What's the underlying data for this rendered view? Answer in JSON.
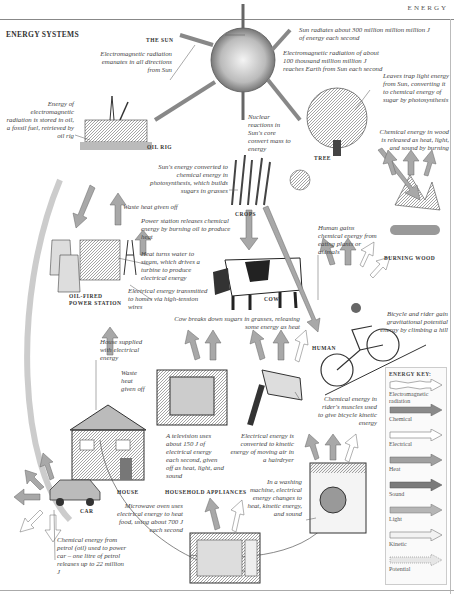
{
  "header": {
    "running_head": "ENERGY",
    "title": "ENERGY SYSTEMS"
  },
  "labels": {
    "sun": "THE SUN",
    "oil_rig": "OIL RIG",
    "tree": "TREE",
    "crops": "CROPS",
    "burning_wood": "BURNING WOOD",
    "power_station_1": "OIL-FIRED",
    "power_station_2": "POWER STATION",
    "cow": "COW",
    "human": "HUMAN",
    "house": "HOUSE",
    "household_appliances": "HOUSEHOLD APPLIANCES",
    "car": "CAR"
  },
  "notes": {
    "sun_em": "Electromagnetic radiation emanates in all directions from Sun",
    "sun_radiates": "Sun radiates about 300 million million million J of energy each second",
    "earth_receives": "Electromagnetic radiation of about 100 thousand million million J reaches Earth from Sun each second",
    "oil_stored": "Energy of electromagnetic radiation is stored in oil, a fossil fuel, retrieved by oil rig",
    "leaves": "Leaves trap light energy from Sun, converting it to chemical energy of sugar by photosynthesis",
    "nuclear": "Nuclear reactions in Sun's core convert mass to energy",
    "wood_burn": "Chemical energy in wood is released as heat, light, and sound by burning",
    "photosynthesis": "Sun's energy converted to chemical energy in photosynthesis, which builds sugars in grasses",
    "waste_heat_ps": "Waste heat given off",
    "power_release": "Power station releases chemical energy by burning oil to produce heat",
    "steam": "Heat turns water to steam, which drives a turbine to produce electrical energy",
    "transmitted": "Electrical energy transmitted to homes via high-tension wires",
    "human_gains": "Human gains chemical energy from eating plants or animals",
    "cow_breaks": "Cow breaks down sugars in grasses, releasing some energy as heat",
    "bicycle_potential": "Bicycle and rider gain gravitational potential energy by climbing a hill",
    "house_supplied": "House supplied with electrical energy",
    "waste_heat_house": "Waste heat given off",
    "rider_muscles": "Chemical energy in rider's muscles used to give bicycle kinetic energy",
    "television": "A television uses about 150 J of electrical energy each second, given off as heat, light, and sound",
    "hairdryer": "Electrical energy is converted to kinetic energy of moving air in a hairdryer",
    "washing": "In a washing machine, electrical energy changes to heat, kinetic energy, and sound",
    "microwave": "Microwave oven uses electrical energy to heat food, using about 700 J each second",
    "car_petrol": "Chemical energy from petrol (oil) used to power car – one litre of petrol releases up to 22 million J"
  },
  "key": {
    "title": "ENERGY KEY:",
    "items": [
      {
        "label": "Electromagnetic radiation",
        "color": "#ffffff",
        "wavy": true
      },
      {
        "label": "Chemical",
        "color": "#8a8a8a"
      },
      {
        "label": "Electrical",
        "color": "#ffffff"
      },
      {
        "label": "Heat",
        "color": "#a0a0a0"
      },
      {
        "label": "Sound",
        "color": "#7a7a7a"
      },
      {
        "label": "Light",
        "color": "#b5b5b5"
      },
      {
        "label": "Kinetic",
        "color": "#f2f2f2"
      },
      {
        "label": "Potential",
        "color": "#e6e6e6"
      }
    ]
  }
}
